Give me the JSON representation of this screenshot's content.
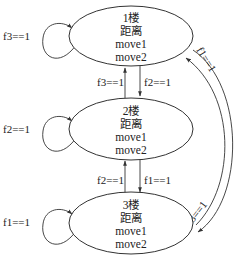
{
  "diagram": {
    "type": "state-machine",
    "nodes": [
      {
        "id": "floor1",
        "lines": [
          "1楼",
          "距离",
          "move1",
          "move2"
        ]
      },
      {
        "id": "floor2",
        "lines": [
          "2楼",
          "距离",
          "move1",
          "move2"
        ]
      },
      {
        "id": "floor3",
        "lines": [
          "3楼",
          "距离",
          "move1",
          "move2"
        ]
      }
    ],
    "edges": {
      "self_floor1": "f3==1",
      "self_floor2": "f2==1",
      "self_floor3": "f1==1",
      "floor2_to_floor1": "f3==1",
      "floor1_to_floor2": "f2==1",
      "floor3_to_floor2": "f2==1",
      "floor2_to_floor3": "f1==1",
      "floor3_to_floor1": "f1==1",
      "floor1_to_floor3": "f3==1"
    },
    "colors": {
      "stroke": "#333333",
      "text": "#222222",
      "background": "#ffffff"
    }
  }
}
